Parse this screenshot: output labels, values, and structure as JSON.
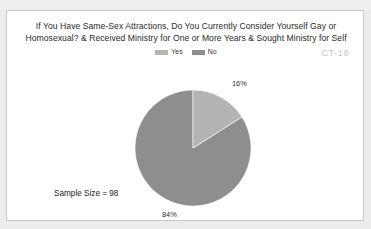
{
  "chart_data": {
    "type": "pie",
    "title": "If You Have Same-Sex Attractions, Do You Currently Consider Yourself Gay or Homosexual? & Received Ministry for One or More Years & Sought Ministry for Self",
    "title_line_1": "If You Have Same-Sex Attractions, Do You Currently Consider Yourself Gay or",
    "title_line_2": "Homosexual? & Received Ministry for One or More Years & Sought Ministry for Self",
    "categories": [
      "Yes",
      "No"
    ],
    "values": [
      16,
      84
    ],
    "value_labels": [
      "16%",
      "84%"
    ],
    "unit": "percent",
    "colors": [
      "#b4b4b4",
      "#8e8e8e"
    ],
    "sample_size_label": "Sample Size = 98",
    "sample_size": 98,
    "legend_position": "top-center",
    "start_angle_deg": 0,
    "direction": "clockwise",
    "grid": false,
    "xlabel": "",
    "ylabel": ""
  },
  "legend": {
    "items": [
      {
        "label": "Yes",
        "color": "#b4b4b4",
        "swatch_name": "legend-swatch-yes"
      },
      {
        "label": "No",
        "color": "#8e8e8e",
        "swatch_name": "legend-swatch-no"
      }
    ]
  },
  "annotations": {
    "corner_code": "CT-18"
  },
  "slice_labels": {
    "yes": "16%",
    "no": "84%"
  }
}
